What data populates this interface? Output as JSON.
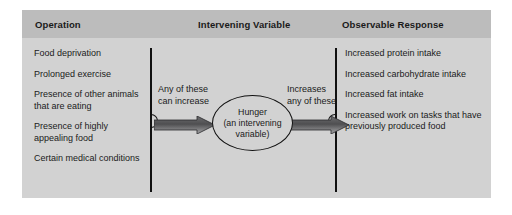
{
  "figure": {
    "background_color": "#d2d2d2",
    "header_band_color": "#bcbcbc",
    "columns": {
      "operation": {
        "title": "Operation",
        "items": [
          "Food deprivation",
          "Prolonged exercise",
          "Presence of other animals that are eating",
          "Presence of highly appealing food",
          "Certain medical conditions"
        ]
      },
      "intervening_variable": {
        "title": "Intervening Variable",
        "left_arrow_label": "Any of these\ncan increase",
        "right_arrow_label": "Increases\nany of these",
        "oval_text": "Hunger\n(an intervening\nvariable)",
        "arrow_color_dark": "#58585a",
        "arrow_color_light": "#b4b4b6"
      },
      "observable_response": {
        "title": "Observable Response",
        "items": [
          "Increased protein intake",
          "Increased carbohydrate intake",
          "Increased fat intake",
          "Increased work on tasks that have previously produced food"
        ]
      }
    }
  }
}
